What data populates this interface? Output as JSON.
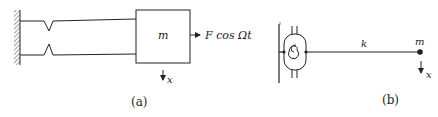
{
  "figure_a": {
    "mass_label": "m",
    "force_label": "F cos Ωt",
    "displacement_label": "x",
    "caption": "(a)"
  },
  "figure_b": {
    "stiffness_label": "k",
    "mass_label": "m",
    "displacement_label": "x",
    "caption": "(b)"
  },
  "colors": {
    "stroke": "#222222",
    "background": "#ffffff"
  }
}
